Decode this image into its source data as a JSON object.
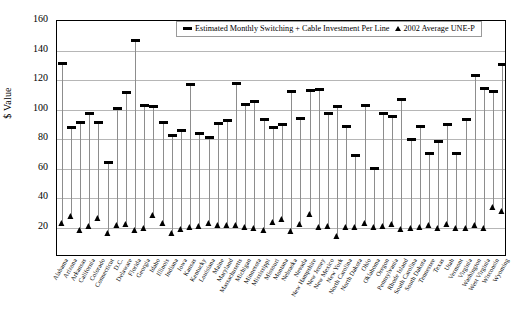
{
  "chart_data": {
    "type": "scatter",
    "title": "",
    "xlabel": "",
    "ylabel": "$ Value",
    "ylim": [
      0,
      160
    ],
    "ytick_step": 20,
    "yticks": [
      0,
      20,
      40,
      60,
      80,
      100,
      120,
      140,
      160
    ],
    "grid": true,
    "legend_position": "top-center",
    "categories": [
      "Alabama",
      "Arizona",
      "Arkansas",
      "California",
      "Colorado",
      "Connecticut",
      "D.C.",
      "Delaware",
      "Florida",
      "Georgia",
      "Idaho",
      "Illinois",
      "Indiana",
      "Iowa",
      "Kansas",
      "Kentucky",
      "Louisiana",
      "Maine",
      "Maryland",
      "Massachusetts",
      "Michigan",
      "Minnesota",
      "Mississippi",
      "Missouri",
      "Montana",
      "Nebraska",
      "Nevada",
      "New Hampshire",
      "New Jersey",
      "New Mexico",
      "New York",
      "North Carolina",
      "North Dakota",
      "Ohio",
      "Oklahoma",
      "Oregon",
      "Pennsylvania",
      "Rhode Island",
      "South Carolina",
      "South Dakota",
      "Tennessee",
      "Texas",
      "Utah",
      "Vermont",
      "Virginia",
      "Washington",
      "West Virginia",
      "Wisconsin",
      "Wyoming"
    ],
    "series": [
      {
        "name": "Estimated Monthly Switching + Cable Investment Per Line",
        "marker": "dash",
        "color": "#000000",
        "values": [
          131.5,
          88.0,
          91.5,
          97.5,
          91.5,
          64.0,
          101.0,
          111.5,
          146.5,
          102.5,
          102.0,
          91.5,
          82.5,
          86.0,
          117.0,
          84.0,
          81.0,
          90.5,
          92.5,
          117.5,
          103.5,
          105.5,
          93.5,
          88.0,
          90.0,
          112.5,
          94.0,
          113.0,
          113.5,
          97.5,
          102.0,
          88.5,
          69.0,
          102.5,
          60.0,
          97.0,
          95.5,
          106.5,
          79.5,
          88.5,
          70.5,
          78.5,
          90.0,
          70.0,
          93.5,
          123.0,
          114.5,
          112.0,
          130.5
        ]
      },
      {
        "name": "2002 Average UNE-P",
        "marker": "triangle",
        "color": "#000000",
        "values": [
          23.0,
          27.5,
          18.0,
          21.0,
          26.5,
          16.5,
          22.0,
          22.5,
          18.0,
          19.5,
          28.5,
          23.0,
          16.0,
          19.0,
          20.5,
          21.0,
          23.0,
          22.0,
          21.5,
          22.0,
          20.5,
          19.5,
          18.5,
          23.5,
          25.5,
          17.5,
          22.5,
          29.0,
          20.5,
          21.0,
          14.0,
          20.5,
          20.5,
          23.0,
          20.5,
          21.0,
          22.5,
          19.0,
          19.5,
          20.5,
          21.5,
          20.0,
          22.5,
          20.0,
          19.5,
          21.5,
          20.0,
          34.0,
          31.5
        ]
      }
    ]
  },
  "legend": {
    "entries": [
      {
        "label": "Estimated Monthly Switching + Cable Investment Per Line",
        "marker": "dash"
      },
      {
        "label": "2002 Average UNE-P",
        "marker": "triangle"
      }
    ]
  },
  "axes": {
    "y_title": "$ Value"
  }
}
